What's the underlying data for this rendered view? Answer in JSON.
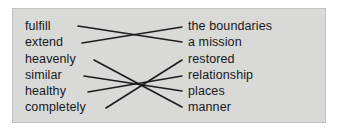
{
  "exercise": {
    "type": "matching-lines",
    "panel_background": "#d9d9d7",
    "page_background": "#ffffff",
    "text_color": "#17171a",
    "line_color": "#1d1d20",
    "left_column": [
      {
        "id": "l0",
        "label": "fulfill"
      },
      {
        "id": "l1",
        "label": "extend"
      },
      {
        "id": "l2",
        "label": "heavenly"
      },
      {
        "id": "l3",
        "label": "similar"
      },
      {
        "id": "l4",
        "label": "healthy"
      },
      {
        "id": "l5",
        "label": "completely"
      }
    ],
    "right_column": [
      {
        "id": "r0",
        "label": "the boundaries"
      },
      {
        "id": "r1",
        "label": "a mission"
      },
      {
        "id": "r2",
        "label": "restored"
      },
      {
        "id": "r3",
        "label": "relationship"
      },
      {
        "id": "r4",
        "label": "places"
      },
      {
        "id": "r5",
        "label": "manner"
      }
    ],
    "connections": [
      {
        "from": "fulfill",
        "to": "a mission",
        "x1": 66,
        "y1": 18,
        "x2": 170,
        "y2": 34
      },
      {
        "from": "extend",
        "to": "the boundaries",
        "x1": 70,
        "y1": 35,
        "x2": 170,
        "y2": 19
      },
      {
        "from": "heavenly",
        "to": "manner",
        "x1": 82,
        "y1": 52,
        "x2": 170,
        "y2": 99
      },
      {
        "from": "similar",
        "to": "places",
        "x1": 72,
        "y1": 68,
        "x2": 170,
        "y2": 83
      },
      {
        "from": "healthy",
        "to": "relationship",
        "x1": 76,
        "y1": 84,
        "x2": 170,
        "y2": 68
      },
      {
        "from": "completely",
        "to": "restored",
        "x1": 94,
        "y1": 100,
        "x2": 170,
        "y2": 52
      }
    ]
  }
}
